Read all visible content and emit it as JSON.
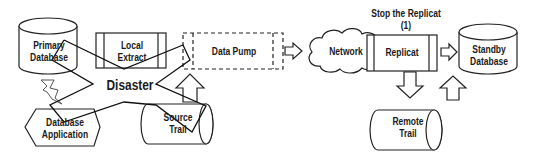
{
  "diagram": {
    "nodes": {
      "primary_db": {
        "line1": "Primary",
        "line2": "Database"
      },
      "local_extract": {
        "line1": "Local",
        "line2": "Extract"
      },
      "data_pump": {
        "label": "Data Pump"
      },
      "network": {
        "label": "Network"
      },
      "replicat": {
        "label": "Replicat"
      },
      "standby_db": {
        "line1": "Standby",
        "line2": "Database"
      },
      "db_app": {
        "line1": "Database",
        "line2": "Application"
      },
      "source_trail": {
        "line1": "Source",
        "line2": "Trail"
      },
      "remote_trail": {
        "line1": "Remote",
        "line2": "Trail"
      }
    },
    "disaster_label": "Disaster",
    "annotation": {
      "line1": "Stop the Replicat",
      "line2": "(1)"
    }
  }
}
